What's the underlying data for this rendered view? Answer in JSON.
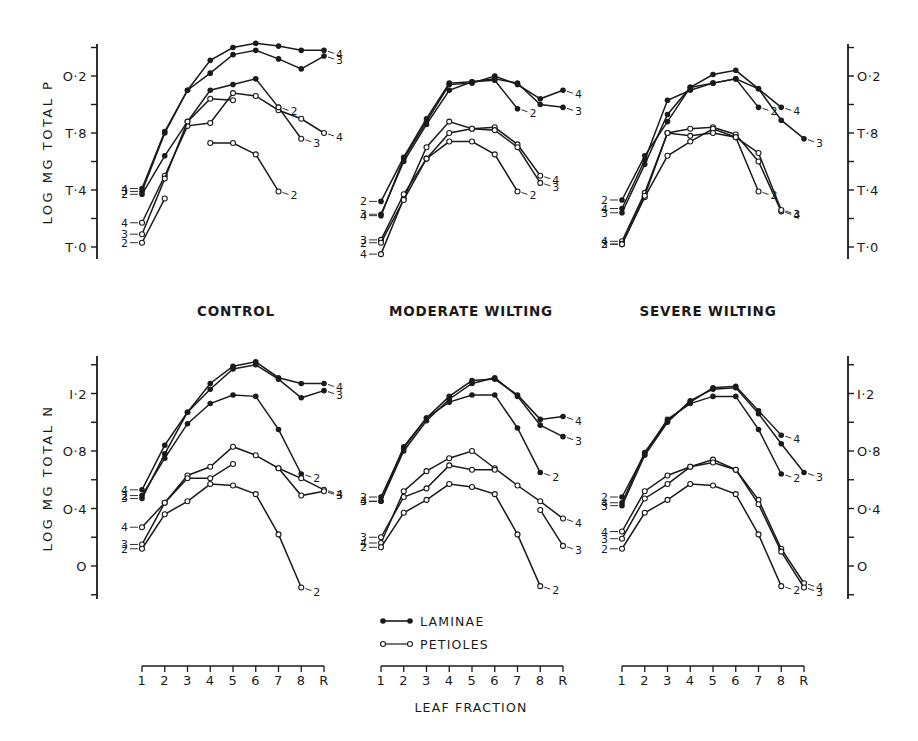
{
  "figure": {
    "panel_titles": [
      "CONTROL",
      "MODERATE WILTING",
      "SEVERE WILTING"
    ],
    "x_axis_label": "LEAF FRACTION",
    "x_ticks": [
      "1",
      "2",
      "3",
      "4",
      "5",
      "6",
      "7",
      "8",
      "R"
    ],
    "y_axis_top_label": "LOG MG TOTAL P",
    "y_axis_bottom_label": "LOG MG TOTAL N",
    "y_ticks_P": [
      "T·0",
      "T·4",
      "T·8",
      "O·2"
    ],
    "y_ticks_N": [
      "O",
      "O·4",
      "O·8",
      "I·2"
    ],
    "legend": {
      "laminae": "LAMINAE",
      "petioles": "PETIOLES"
    },
    "colors": {
      "ink": "#1a1a1a",
      "background": "#ffffff"
    }
  },
  "chart_data": [
    {
      "type": "line",
      "title": "CONTROL",
      "ylabel": "LOG MG TOTAL P",
      "xlabel": "LEAF FRACTION",
      "categories": [
        "1",
        "2",
        "3",
        "4",
        "5",
        "6",
        "7",
        "8",
        "R"
      ],
      "y_tick_labels": {
        "0": "T·0",
        "0.4": "T·4",
        "0.8": "T·8",
        "1.2": "O·2"
      },
      "ylim": [
        -0.1,
        1.5
      ],
      "series": [
        {
          "name": "Laminae 4",
          "part": "laminae",
          "label": "4",
          "values": [
            0.41,
            0.81,
            1.1,
            1.31,
            1.4,
            1.43,
            1.41,
            1.38,
            1.38
          ]
        },
        {
          "name": "Laminae 3",
          "part": "laminae",
          "label": "3",
          "values": [
            0.39,
            0.8,
            1.1,
            1.22,
            1.35,
            1.38,
            1.32,
            1.25,
            1.34
          ]
        },
        {
          "name": "Laminae 2",
          "part": "laminae",
          "label": "2",
          "values": [
            0.37,
            0.64,
            0.88,
            1.1,
            1.14,
            1.18,
            0.98,
            null,
            null
          ]
        },
        {
          "name": "Petioles 4",
          "part": "petioles",
          "label": "4",
          "values": [
            0.17,
            0.5,
            0.85,
            0.87,
            1.08,
            1.06,
            0.96,
            0.9,
            0.8
          ]
        },
        {
          "name": "Petioles 3",
          "part": "petioles",
          "label": "3",
          "values": [
            0.09,
            0.48,
            0.88,
            1.04,
            1.03,
            null,
            0.98,
            0.76,
            null
          ]
        },
        {
          "name": "Petioles 2",
          "part": "petioles",
          "label": "2",
          "values": [
            0.03,
            0.34,
            null,
            0.73,
            0.73,
            0.65,
            0.39,
            null,
            null
          ]
        }
      ]
    },
    {
      "type": "line",
      "title": "MODERATE WILTING",
      "ylabel": "LOG MG TOTAL P",
      "xlabel": "LEAF FRACTION",
      "categories": [
        "1",
        "2",
        "3",
        "4",
        "5",
        "6",
        "7",
        "8",
        "R"
      ],
      "ylim": [
        -0.1,
        1.5
      ],
      "series": [
        {
          "name": "Laminae 4",
          "part": "laminae",
          "label": "4",
          "values": [
            0.22,
            0.62,
            0.88,
            1.14,
            1.15,
            1.2,
            1.14,
            1.04,
            1.1
          ]
        },
        {
          "name": "Laminae 3",
          "part": "laminae",
          "label": "3",
          "values": [
            0.23,
            0.6,
            0.86,
            1.1,
            1.16,
            1.18,
            1.15,
            1.0,
            0.98
          ]
        },
        {
          "name": "Laminae 2",
          "part": "laminae",
          "label": "2",
          "values": [
            0.32,
            0.63,
            0.9,
            1.15,
            1.16,
            1.17,
            0.97,
            null,
            null
          ]
        },
        {
          "name": "Petioles 4",
          "part": "petioles",
          "label": "4",
          "values": [
            -0.05,
            0.34,
            0.7,
            0.88,
            0.83,
            0.84,
            0.72,
            0.5,
            null
          ]
        },
        {
          "name": "Petioles 3",
          "part": "petioles",
          "label": "3",
          "values": [
            0.05,
            0.37,
            0.62,
            0.8,
            0.83,
            0.82,
            0.7,
            0.45,
            null
          ]
        },
        {
          "name": "Petioles 2",
          "part": "petioles",
          "label": "2",
          "values": [
            0.03,
            0.33,
            0.62,
            0.74,
            0.74,
            0.65,
            0.39,
            null,
            null
          ]
        }
      ]
    },
    {
      "type": "line",
      "title": "SEVERE WILTING",
      "ylabel": "LOG MG TOTAL P",
      "xlabel": "LEAF FRACTION",
      "categories": [
        "1",
        "2",
        "3",
        "4",
        "5",
        "6",
        "7",
        "8",
        "R"
      ],
      "ylim": [
        -0.1,
        1.5
      ],
      "series": [
        {
          "name": "Laminae 4",
          "part": "laminae",
          "label": "4",
          "values": [
            0.27,
            0.61,
            1.03,
            1.1,
            1.15,
            1.18,
            1.11,
            0.98,
            null
          ]
        },
        {
          "name": "Laminae 3",
          "part": "laminae",
          "label": "3",
          "values": [
            0.24,
            0.58,
            0.93,
            1.12,
            1.21,
            1.24,
            1.11,
            0.89,
            0.76
          ]
        },
        {
          "name": "Laminae 2",
          "part": "laminae",
          "label": "2",
          "values": [
            0.33,
            0.64,
            0.88,
            1.12,
            1.15,
            1.18,
            0.98,
            null,
            null
          ]
        },
        {
          "name": "Petioles 4",
          "part": "petioles",
          "label": "4",
          "values": [
            0.04,
            0.38,
            0.8,
            0.83,
            0.84,
            0.79,
            0.6,
            0.25,
            null
          ]
        },
        {
          "name": "Petioles 3",
          "part": "petioles",
          "label": "3",
          "values": [
            0.02,
            0.35,
            0.64,
            0.74,
            0.83,
            0.77,
            0.66,
            0.26,
            null
          ]
        },
        {
          "name": "Petioles 2",
          "part": "petioles",
          "label": "2",
          "values": [
            0.02,
            0.36,
            0.8,
            0.78,
            0.8,
            0.77,
            0.39,
            null,
            null
          ]
        }
      ]
    },
    {
      "type": "line",
      "title": "CONTROL",
      "ylabel": "LOG MG TOTAL N",
      "xlabel": "LEAF FRACTION",
      "categories": [
        "1",
        "2",
        "3",
        "4",
        "5",
        "6",
        "7",
        "8",
        "R"
      ],
      "y_tick_labels": {
        "0": "O",
        "0.4": "O·4",
        "0.8": "O·8",
        "1.2": "I·2"
      },
      "ylim": [
        -0.2,
        1.45
      ],
      "series": [
        {
          "name": "Laminae 4",
          "part": "laminae",
          "label": "4",
          "values": [
            0.53,
            0.84,
            1.07,
            1.27,
            1.39,
            1.42,
            1.31,
            1.27,
            1.27
          ]
        },
        {
          "name": "Laminae 3",
          "part": "laminae",
          "label": "3",
          "values": [
            0.47,
            0.78,
            1.07,
            1.23,
            1.37,
            1.4,
            1.3,
            1.17,
            1.22
          ]
        },
        {
          "name": "Laminae 2",
          "part": "laminae",
          "label": "2",
          "values": [
            0.49,
            0.75,
            0.99,
            1.13,
            1.19,
            1.18,
            0.95,
            0.64,
            null
          ]
        },
        {
          "name": "Petioles 4",
          "part": "petioles",
          "label": "4",
          "values": [
            0.27,
            0.44,
            0.63,
            0.69,
            0.83,
            0.77,
            0.68,
            0.61,
            0.53
          ]
        },
        {
          "name": "Petioles 3",
          "part": "petioles",
          "label": "3",
          "values": [
            0.15,
            0.44,
            0.61,
            0.61,
            0.71,
            null,
            0.68,
            0.49,
            0.52
          ]
        },
        {
          "name": "Petioles 2",
          "part": "petioles",
          "label": "2",
          "values": [
            0.12,
            0.36,
            0.45,
            0.57,
            0.56,
            0.5,
            0.22,
            -0.15,
            null
          ]
        }
      ]
    },
    {
      "type": "line",
      "title": "MODERATE WILTING",
      "ylabel": "LOG MG TOTAL N",
      "xlabel": "LEAF FRACTION",
      "categories": [
        "1",
        "2",
        "3",
        "4",
        "5",
        "6",
        "7",
        "8",
        "R"
      ],
      "ylim": [
        -0.2,
        1.45
      ],
      "series": [
        {
          "name": "Laminae 4",
          "part": "laminae",
          "label": "4",
          "values": [
            0.45,
            0.83,
            1.03,
            1.18,
            1.29,
            1.3,
            1.19,
            1.02,
            1.04
          ]
        },
        {
          "name": "Laminae 3",
          "part": "laminae",
          "label": "3",
          "values": [
            0.45,
            0.8,
            1.01,
            1.16,
            1.27,
            1.31,
            1.18,
            0.98,
            0.9
          ]
        },
        {
          "name": "Laminae 2",
          "part": "laminae",
          "label": "2",
          "values": [
            0.48,
            0.82,
            1.03,
            1.14,
            1.19,
            1.19,
            0.96,
            0.65,
            null
          ]
        },
        {
          "name": "Petioles 4",
          "part": "petioles",
          "label": "4",
          "values": [
            0.16,
            0.52,
            0.66,
            0.75,
            0.8,
            0.68,
            0.56,
            0.45,
            0.33
          ]
        },
        {
          "name": "Petioles 3",
          "part": "petioles",
          "label": "3",
          "values": [
            0.2,
            0.48,
            0.54,
            0.7,
            0.67,
            0.67,
            null,
            0.39,
            0.14
          ]
        },
        {
          "name": "Petioles 2",
          "part": "petioles",
          "label": "2",
          "values": [
            0.13,
            0.37,
            0.46,
            0.57,
            0.55,
            0.5,
            0.22,
            -0.14,
            null
          ]
        }
      ]
    },
    {
      "type": "line",
      "title": "SEVERE WILTING",
      "ylabel": "LOG MG TOTAL N",
      "xlabel": "LEAF FRACTION",
      "categories": [
        "1",
        "2",
        "3",
        "4",
        "5",
        "6",
        "7",
        "8",
        "R"
      ],
      "ylim": [
        -0.2,
        1.45
      ],
      "series": [
        {
          "name": "Laminae 4",
          "part": "laminae",
          "label": "4",
          "values": [
            0.44,
            0.79,
            1.01,
            1.14,
            1.24,
            1.25,
            1.08,
            0.91,
            null
          ]
        },
        {
          "name": "Laminae 3",
          "part": "laminae",
          "label": "3",
          "values": [
            0.42,
            0.77,
            1.0,
            1.15,
            1.23,
            1.24,
            1.06,
            0.85,
            0.65
          ]
        },
        {
          "name": "Laminae 2",
          "part": "laminae",
          "label": "2",
          "values": [
            0.48,
            0.78,
            1.02,
            1.13,
            1.18,
            1.18,
            0.95,
            0.64,
            null
          ]
        },
        {
          "name": "Petioles 4",
          "part": "petioles",
          "label": "4",
          "values": [
            0.24,
            0.52,
            0.63,
            0.69,
            0.74,
            0.67,
            0.46,
            0.12,
            -0.12
          ]
        },
        {
          "name": "Petioles 3",
          "part": "petioles",
          "label": "3",
          "values": [
            0.19,
            0.47,
            0.57,
            0.69,
            0.72,
            0.67,
            0.43,
            0.1,
            -0.15
          ]
        },
        {
          "name": "Petioles 2",
          "part": "petioles",
          "label": "2",
          "values": [
            0.12,
            0.37,
            0.46,
            0.57,
            0.56,
            0.5,
            0.22,
            -0.14,
            null
          ]
        }
      ]
    }
  ]
}
